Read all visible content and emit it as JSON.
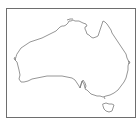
{
  "map": {
    "subject": "Australia outline",
    "regions": [
      {
        "name": "mainland"
      },
      {
        "name": "tasmania"
      }
    ],
    "colors": {
      "background": "#ffffff",
      "frame_border": "#6e6e6e",
      "coastline": "#8a8a8a"
    }
  }
}
